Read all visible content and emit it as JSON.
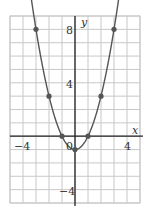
{
  "chart_data": {
    "type": "line",
    "title": "",
    "function": "y = x^2 - 1",
    "xlabel": "x",
    "ylabel": "y",
    "xlim": [
      -5,
      5
    ],
    "ylim": [
      -5,
      9
    ],
    "grid": true,
    "x_ticks_labeled": [
      -4,
      4
    ],
    "y_ticks_labeled": [
      8,
      4,
      -4
    ],
    "origin_label": "0",
    "points": [
      {
        "x": -3,
        "y": 8
      },
      {
        "x": -2,
        "y": 3
      },
      {
        "x": -1,
        "y": 0
      },
      {
        "x": 0,
        "y": -1
      },
      {
        "x": 1,
        "y": 0
      },
      {
        "x": 2,
        "y": 3
      },
      {
        "x": 3,
        "y": 8
      }
    ]
  },
  "labels": {
    "x_axis": "x",
    "y_axis": "y",
    "tick_x_neg4": "−4",
    "tick_x_4": "4",
    "tick_y_8": "8",
    "tick_y_4": "4",
    "tick_y_neg4": "−4",
    "origin": "0"
  },
  "colors": {
    "grid": "#c8c8c8",
    "axis": "#222222",
    "curve": "#555555",
    "point": "#555555"
  }
}
